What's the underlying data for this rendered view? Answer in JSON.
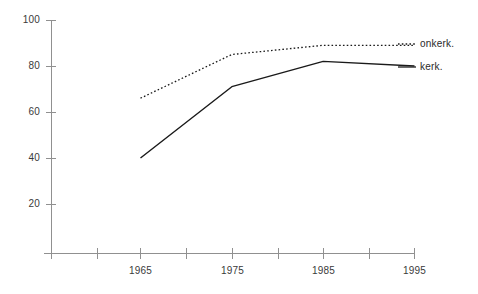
{
  "chart_data": {
    "type": "line",
    "title": "",
    "subtitle": "",
    "xlabel": "",
    "ylabel": "",
    "x": [
      1965,
      1975,
      1985,
      1995
    ],
    "xlim": [
      1960,
      1995
    ],
    "ylim": [
      0,
      100
    ],
    "grid": false,
    "legend_position": "right-inline",
    "x_tick_labels": [
      "1965",
      "1975",
      "1985",
      "1995"
    ],
    "y_tick_labels": [
      "20",
      "40",
      "60",
      "80",
      "100"
    ],
    "y_ticks": [
      20,
      40,
      60,
      80,
      100
    ],
    "series": [
      {
        "name": "onkerk.",
        "label": "onkerk.",
        "style": "dotted",
        "color": "#1a1a1a",
        "values": [
          66,
          85,
          89,
          89
        ]
      },
      {
        "name": "kerk.",
        "label": "kerk.",
        "style": "solid",
        "color": "#1a1a1a",
        "values": [
          40,
          71,
          82,
          80
        ]
      }
    ],
    "axis_color": "#808080",
    "annotations": []
  },
  "axis": {
    "y_labels": [
      {
        "text": "100",
        "value": 100
      },
      {
        "text": "80",
        "value": 80
      },
      {
        "text": "60",
        "value": 60
      },
      {
        "text": "40",
        "value": 40
      },
      {
        "text": "20",
        "value": 20
      }
    ],
    "x_labels": [
      {
        "text": "1965",
        "value": 1965
      },
      {
        "text": "1975",
        "value": 1975
      },
      {
        "text": "1985",
        "value": 1985
      },
      {
        "text": "1995",
        "value": 1995
      }
    ]
  },
  "legend": {
    "entries": [
      {
        "label": "onkerk."
      },
      {
        "label": "kerk."
      }
    ]
  }
}
